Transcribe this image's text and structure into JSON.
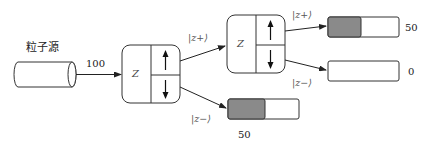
{
  "source": {
    "label": "粒子源",
    "count_label": "100"
  },
  "devices": [
    {
      "id": "sg1",
      "axis_label": "Z",
      "up_arrow": "arrow-up",
      "down_arrow": "arrow-down"
    },
    {
      "id": "sg2",
      "axis_label": "Z",
      "up_arrow": "arrow-up",
      "down_arrow": "arrow-down"
    }
  ],
  "beams": {
    "sg1_up": "|z+⟩",
    "sg1_down": "|z−⟩",
    "sg2_up": "|z+⟩",
    "sg2_down": "|z−⟩"
  },
  "detectors": [
    {
      "id": "det-sg1-down",
      "count": "50",
      "fill_fraction": 0.5,
      "fill_color": "#8a8a8a"
    },
    {
      "id": "det-sg2-up",
      "count": "50",
      "fill_fraction": 0.5,
      "fill_color": "#8a8a8a"
    },
    {
      "id": "det-sg2-down",
      "count": "0",
      "fill_fraction": 0,
      "fill_color": "#8a8a8a"
    }
  ]
}
